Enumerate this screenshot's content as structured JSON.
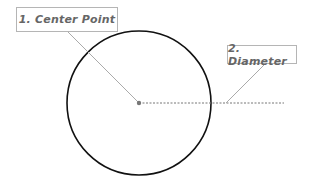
{
  "diagram": {
    "type": "circle-anatomy",
    "labels": [
      {
        "id": "center-point",
        "text": "1. Center Point"
      },
      {
        "id": "diameter",
        "text": "2. Diameter"
      }
    ],
    "colors": {
      "circle_stroke": "#111111",
      "leader_line": "#aaaaaa",
      "dashed_line": "#777777",
      "center_dot": "#777777",
      "label_text": "#666666",
      "label_border": "#b5b5b5"
    }
  }
}
